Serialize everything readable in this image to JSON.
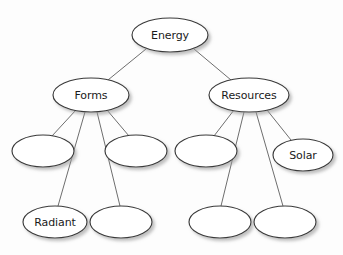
{
  "diagram": {
    "type": "concept-map-tree",
    "title": "Energy",
    "canvas": {
      "width": 343,
      "height": 255,
      "background": "#fdfdfd"
    },
    "style": {
      "node_fill": "#ffffff",
      "node_stroke": "#3a3a3a",
      "edge_stroke": "#6e6e6e",
      "label_color": "#1a1a1a",
      "shadow_color": "#b4b4b4"
    },
    "nodes": [
      {
        "id": "energy",
        "label": "Energy",
        "cx": 170,
        "cy": 35,
        "rx": 38,
        "ry": 17,
        "level": 0,
        "blank": false
      },
      {
        "id": "forms",
        "label": "Forms",
        "cx": 91,
        "cy": 95,
        "rx": 38,
        "ry": 17,
        "level": 1,
        "blank": false
      },
      {
        "id": "resources",
        "label": "Resources",
        "cx": 249,
        "cy": 95,
        "rx": 40,
        "ry": 17,
        "level": 1,
        "blank": false
      },
      {
        "id": "forms-c1",
        "label": "",
        "cx": 43,
        "cy": 151,
        "rx": 31,
        "ry": 16,
        "level": 2,
        "blank": true
      },
      {
        "id": "forms-c2",
        "label": "",
        "cx": 136,
        "cy": 151,
        "rx": 31,
        "ry": 16,
        "level": 2,
        "blank": true
      },
      {
        "id": "radiant",
        "label": "Radiant",
        "cx": 55,
        "cy": 222,
        "rx": 32,
        "ry": 16,
        "level": 3,
        "blank": false
      },
      {
        "id": "forms-c4",
        "label": "",
        "cx": 121,
        "cy": 222,
        "rx": 31,
        "ry": 16,
        "level": 3,
        "blank": true
      },
      {
        "id": "res-c1",
        "label": "",
        "cx": 206,
        "cy": 151,
        "rx": 31,
        "ry": 16,
        "level": 2,
        "blank": true
      },
      {
        "id": "solar",
        "label": "Solar",
        "cx": 303,
        "cy": 155,
        "rx": 30,
        "ry": 16,
        "level": 2,
        "blank": false
      },
      {
        "id": "res-c3",
        "label": "",
        "cx": 220,
        "cy": 222,
        "rx": 31,
        "ry": 16,
        "level": 3,
        "blank": true
      },
      {
        "id": "res-c4",
        "label": "",
        "cx": 285,
        "cy": 222,
        "rx": 31,
        "ry": 16,
        "level": 3,
        "blank": true
      }
    ],
    "edges": [
      {
        "id": "edge-energy-forms",
        "from": "energy",
        "to": "forms",
        "x1": 146,
        "y1": 49,
        "x2": 108,
        "y2": 80
      },
      {
        "id": "edge-energy-resources",
        "from": "energy",
        "to": "resources",
        "x1": 194,
        "y1": 49,
        "x2": 231,
        "y2": 80
      },
      {
        "id": "edge-forms-c1",
        "from": "forms",
        "to": "forms-c1",
        "x1": 76,
        "y1": 110,
        "x2": 52,
        "y2": 136
      },
      {
        "id": "edge-forms-radiant",
        "from": "forms",
        "to": "radiant",
        "x1": 85,
        "y1": 112,
        "x2": 58,
        "y2": 206
      },
      {
        "id": "edge-forms-c4",
        "from": "forms",
        "to": "forms-c4",
        "x1": 97,
        "y1": 112,
        "x2": 120,
        "y2": 206
      },
      {
        "id": "edge-forms-c2",
        "from": "forms",
        "to": "forms-c2",
        "x1": 107,
        "y1": 110,
        "x2": 129,
        "y2": 136
      },
      {
        "id": "edge-resources-c1",
        "from": "resources",
        "to": "res-c1",
        "x1": 234,
        "y1": 110,
        "x2": 214,
        "y2": 136
      },
      {
        "id": "edge-resources-c3",
        "from": "resources",
        "to": "res-c3",
        "x1": 244,
        "y1": 112,
        "x2": 221,
        "y2": 206
      },
      {
        "id": "edge-resources-c4",
        "from": "resources",
        "to": "res-c4",
        "x1": 256,
        "y1": 112,
        "x2": 283,
        "y2": 206
      },
      {
        "id": "edge-resources-solar",
        "from": "resources",
        "to": "solar",
        "x1": 267,
        "y1": 110,
        "x2": 291,
        "y2": 140
      }
    ]
  }
}
